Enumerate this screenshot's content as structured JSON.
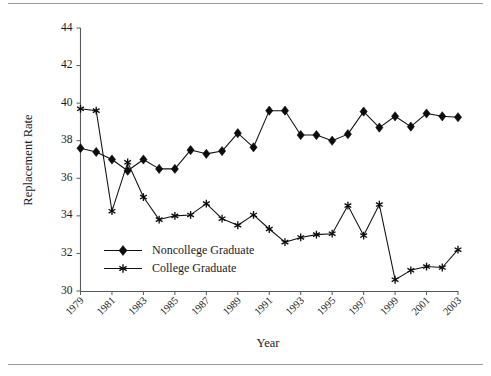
{
  "chart_data": {
    "type": "line",
    "title": "",
    "xlabel": "Year",
    "ylabel": "Replacement Rate",
    "xlim": [
      1979,
      2003
    ],
    "ylim": [
      30,
      44
    ],
    "yticks": [
      30,
      32,
      34,
      36,
      38,
      40,
      42,
      44
    ],
    "xticks": [
      1979,
      1981,
      1983,
      1985,
      1987,
      1989,
      1991,
      1993,
      1995,
      1997,
      1999,
      2001,
      2003
    ],
    "x": [
      1979,
      1980,
      1981,
      1982,
      1983,
      1984,
      1985,
      1986,
      1987,
      1988,
      1989,
      1990,
      1991,
      1992,
      1993,
      1994,
      1995,
      1996,
      1997,
      1998,
      1999,
      2000,
      2001,
      2002,
      2003
    ],
    "grid": false,
    "legend_position": "inside-lower-left",
    "series": [
      {
        "name": "Noncollege Graduate",
        "marker": "diamond",
        "color": "#0c0c0c",
        "values": [
          37.6,
          37.4,
          37.0,
          36.4,
          37.0,
          36.5,
          36.5,
          37.5,
          37.3,
          37.45,
          38.4,
          37.65,
          39.6,
          39.6,
          38.3,
          38.3,
          38.0,
          38.35,
          39.55,
          38.7,
          39.3,
          38.75,
          39.45,
          39.3,
          39.25
        ]
      },
      {
        "name": "College Graduate",
        "marker": "star",
        "color": "#0c0c0c",
        "values": [
          39.7,
          39.6,
          34.25,
          36.85,
          35.0,
          33.8,
          34.0,
          34.05,
          34.65,
          33.85,
          33.5,
          34.05,
          33.3,
          32.6,
          32.85,
          33.0,
          33.05,
          34.55,
          32.95,
          34.6,
          30.6,
          31.1,
          31.3,
          31.25,
          32.2
        ]
      }
    ]
  },
  "axes": {
    "y_title": "Replacement Rate",
    "x_title": "Year",
    "ytick_labels": [
      "44",
      "42",
      "40",
      "38",
      "36",
      "34",
      "32",
      "30"
    ],
    "xtick_labels": [
      "1979",
      "1981",
      "1983",
      "1985",
      "1987",
      "1989",
      "1991",
      "1993",
      "1995",
      "1997",
      "1999",
      "2001",
      "2003"
    ]
  },
  "legend": {
    "entries": [
      {
        "label": "Noncollege Graduate",
        "marker": "diamond"
      },
      {
        "label": "College Graduate",
        "marker": "star"
      }
    ]
  }
}
